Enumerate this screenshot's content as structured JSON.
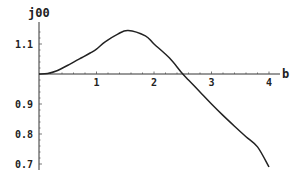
{
  "chart_data": {
    "type": "line",
    "title": "",
    "xlabel": "b",
    "ylabel": "j00",
    "xlim": [
      0,
      4.2
    ],
    "ylim": [
      0.69,
      1.16
    ],
    "axes_origin": {
      "x": 0,
      "y": 1.0
    },
    "grid": false,
    "legend": null,
    "x_ticks": [
      1,
      2,
      3,
      4
    ],
    "x_tick_labels": [
      "1",
      "2",
      "3",
      "4"
    ],
    "y_ticks": [
      0.7,
      0.8,
      0.9,
      1.1
    ],
    "y_tick_labels": [
      "0.7",
      "0.8",
      "0.9",
      "1.1"
    ],
    "series": [
      {
        "name": "j00",
        "color": "#222222",
        "x": [
          0,
          0.15,
          0.3,
          0.54,
          0.75,
          0.89,
          1.0,
          1.15,
          1.37,
          1.55,
          1.85,
          2.0,
          2.27,
          2.47,
          2.6,
          2.8,
          3.0,
          3.2,
          3.4,
          3.6,
          3.8,
          4.0
        ],
        "y": [
          1.0,
          1.002,
          1.01,
          1.033,
          1.055,
          1.07,
          1.083,
          1.107,
          1.133,
          1.145,
          1.127,
          1.1,
          1.053,
          1.007,
          0.98,
          0.94,
          0.9,
          0.862,
          0.826,
          0.791,
          0.757,
          0.69
        ]
      }
    ]
  }
}
